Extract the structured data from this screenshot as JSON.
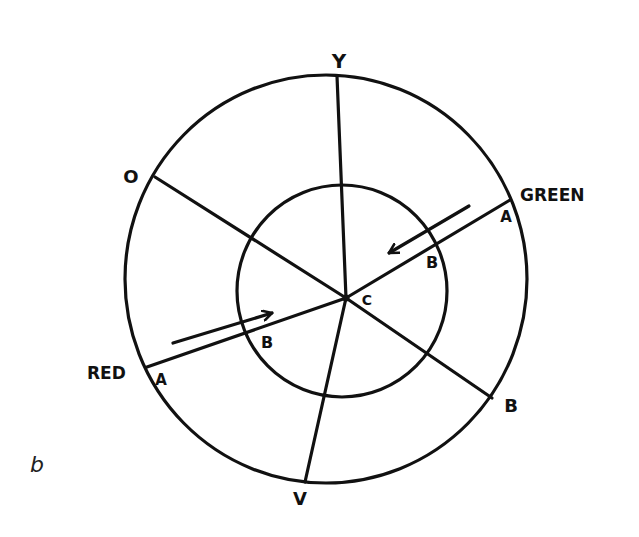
{
  "panel_label": "b",
  "diagram": {
    "type": "color-wheel",
    "center_label": "C",
    "outer_circle": {
      "cx": 326,
      "cy": 279,
      "rx": 201,
      "ry": 204
    },
    "inner_circle": {
      "cx": 342,
      "cy": 291,
      "rx": 105,
      "ry": 106
    },
    "center_point": {
      "x": 346,
      "y": 298
    },
    "radial_lines": [
      {
        "id": "yellow",
        "label": "Y",
        "end": {
          "x": 337,
          "y": 76
        }
      },
      {
        "id": "orange",
        "label": "O",
        "end": {
          "x": 155,
          "y": 177
        }
      },
      {
        "id": "green",
        "label": "GREEN",
        "end": {
          "x": 510,
          "y": 200
        }
      },
      {
        "id": "red",
        "label": "RED",
        "end": {
          "x": 147,
          "y": 367
        }
      },
      {
        "id": "blue",
        "label": "B",
        "end": {
          "x": 492,
          "y": 398
        }
      },
      {
        "id": "violet",
        "label": "V",
        "end": {
          "x": 305,
          "y": 482
        }
      }
    ],
    "point_labels": {
      "green_outer": "A",
      "green_inner": "B",
      "red_outer": "A",
      "red_inner": "B"
    },
    "arrows": [
      {
        "id": "green-arrow",
        "from": {
          "x": 469,
          "y": 206
        },
        "to": {
          "x": 389,
          "y": 253
        }
      },
      {
        "id": "red-arrow",
        "from": {
          "x": 173,
          "y": 343
        },
        "to": {
          "x": 272,
          "y": 313
        }
      }
    ],
    "labels": {
      "y": "Y",
      "o": "O",
      "green": "GREEN",
      "green_a": "A",
      "green_b": "B",
      "c": "C",
      "red": "RED",
      "red_a": "A",
      "red_b": "B",
      "blue": "B",
      "v": "V"
    }
  }
}
